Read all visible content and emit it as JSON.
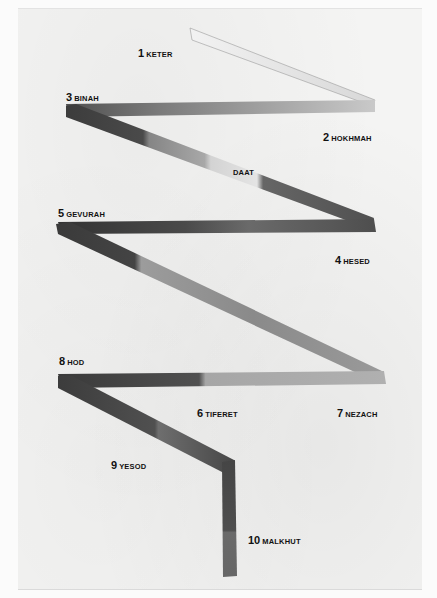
{
  "artwork": {
    "subject": "Tree of Life lightning flash",
    "background_color": "#f4f4f3",
    "stroke_colors": {
      "darkest": "#3a3a3a",
      "dark": "#555555",
      "mid": "#7d7d7d",
      "light": "#a9a9a9",
      "lightest": "#dedede"
    }
  },
  "sefirot": [
    {
      "number": "1",
      "name": "KETER"
    },
    {
      "number": "2",
      "name": "HOKHMAH"
    },
    {
      "number": "3",
      "name": "BINAH"
    },
    {
      "number": "",
      "name": "DAAT"
    },
    {
      "number": "4",
      "name": "HESED"
    },
    {
      "number": "5",
      "name": "GEVURAH"
    },
    {
      "number": "6",
      "name": "TIFERET"
    },
    {
      "number": "7",
      "name": "NEZACH"
    },
    {
      "number": "8",
      "name": "HOD"
    },
    {
      "number": "9",
      "name": "YESOD"
    },
    {
      "number": "10",
      "name": "MALKHUT"
    }
  ]
}
